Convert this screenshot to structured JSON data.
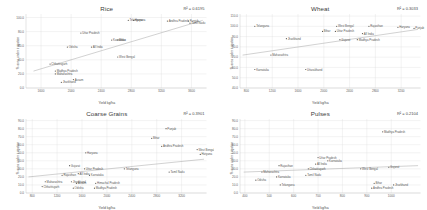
{
  "figure": {
    "layout": "2x2 grid of scatter plots",
    "xlabel": "Yield kg/ha",
    "ylabel": "% area under irrigation"
  },
  "chart_data": [
    {
      "type": "scatter",
      "title": "Rice",
      "annotation": "R² = 0.6195",
      "xlabel": "Yield kg/ha",
      "ylabel": "% area under irrigation",
      "xlim": [
        1400,
        3800
      ],
      "ylim": [
        0,
        105
      ],
      "xticks": [
        1600,
        2000,
        2400,
        2800,
        3200,
        3600
      ],
      "xticklabels": [
        "1600",
        "2000",
        "2400",
        "2800",
        "3200",
        "3600"
      ],
      "yticks": [
        0,
        20,
        40,
        60,
        80,
        100
      ],
      "yticklabels": [
        "0.0",
        "20.0",
        "40.0",
        "60.0",
        "80.0",
        "100.0"
      ],
      "grid": true,
      "trendline": {
        "x": [
          1500,
          3750
        ],
        "y": [
          24,
          96
        ]
      },
      "points": [
        {
          "label": "Telangana",
          "x": 2760,
          "y": 96
        },
        {
          "label": "Haryana",
          "x": 2830,
          "y": 96
        },
        {
          "label": "Andhra Pradesh",
          "x": 3280,
          "y": 95
        },
        {
          "label": "Punjab",
          "x": 3560,
          "y": 95
        },
        {
          "label": "Tamil Nadu",
          "x": 3580,
          "y": 92
        },
        {
          "label": "Uttar Pradesh",
          "x": 2130,
          "y": 78
        },
        {
          "label": "Karnataka",
          "x": 2540,
          "y": 68
        },
        {
          "label": "Bihar",
          "x": 2620,
          "y": 68
        },
        {
          "label": "Odisha",
          "x": 1950,
          "y": 58
        },
        {
          "label": "All India",
          "x": 2270,
          "y": 58
        },
        {
          "label": "West Bengal",
          "x": 2620,
          "y": 44
        },
        {
          "label": "Chhattisgarh",
          "x": 1720,
          "y": 34
        },
        {
          "label": "Madhya Pradesh",
          "x": 1790,
          "y": 24
        },
        {
          "label": "Maharashtra",
          "x": 1790,
          "y": 20
        },
        {
          "label": "Assam",
          "x": 2030,
          "y": 12
        },
        {
          "label": "Jharkhand",
          "x": 1870,
          "y": 8
        }
      ]
    },
    {
      "type": "scatter",
      "title": "Wheat",
      "annotation": "R² = 0.3033",
      "xlabel": "Yield kg/ha",
      "ylabel": "% area under irrigation",
      "xlim": [
        700,
        3500
      ],
      "ylim": [
        40,
        112
      ],
      "xticks": [
        800,
        1200,
        1600,
        2000,
        2400,
        2800,
        3200
      ],
      "xticklabels": [
        "800",
        "1200",
        "1600",
        "2000",
        "2400",
        "2800",
        "3200"
      ],
      "yticks": [
        40,
        50,
        60,
        70,
        80,
        90,
        100,
        110
      ],
      "yticklabels": [
        "40.0",
        "50.0",
        "60.0",
        "70.0",
        "80.0",
        "90.0",
        "100.0",
        "110.0"
      ],
      "grid": true,
      "trendline": {
        "x": [
          740,
          3460
        ],
        "y": [
          72,
          97
        ]
      },
      "points": [
        {
          "label": "Telangana",
          "x": 930,
          "y": 100
        },
        {
          "label": "West Bengal",
          "x": 2200,
          "y": 100
        },
        {
          "label": "Rajasthan",
          "x": 2700,
          "y": 100
        },
        {
          "label": "Haryana",
          "x": 3150,
          "y": 99
        },
        {
          "label": "Punjab",
          "x": 3400,
          "y": 98
        },
        {
          "label": "Bihar",
          "x": 1980,
          "y": 95
        },
        {
          "label": "Uttar Pradesh",
          "x": 2180,
          "y": 95
        },
        {
          "label": "All India",
          "x": 2600,
          "y": 93
        },
        {
          "label": "Jharkhand",
          "x": 1420,
          "y": 88
        },
        {
          "label": "Gujarat",
          "x": 2250,
          "y": 87
        },
        {
          "label": "Madhya Pradesh",
          "x": 2520,
          "y": 87
        },
        {
          "label": "Maharashtra",
          "x": 1180,
          "y": 72
        },
        {
          "label": "Karnataka",
          "x": 930,
          "y": 58
        },
        {
          "label": "Uttarakhand",
          "x": 1720,
          "y": 58
        }
      ]
    },
    {
      "type": "scatter",
      "title": "Coarse Grains",
      "annotation": "R² = 0.3901",
      "xlabel": "Yield kg/ha",
      "ylabel": "% area under irrigation",
      "xlim": [
        700,
        3600
      ],
      "ylim": [
        0,
        92
      ],
      "xticks": [
        800,
        1200,
        1600,
        2000,
        2400,
        2800,
        3200
      ],
      "xticklabels": [
        "800",
        "1200",
        "1600",
        "2000",
        "2400",
        "2800",
        "3200"
      ],
      "yticks": [
        0,
        10,
        20,
        30,
        40,
        50,
        60,
        70,
        80,
        90
      ],
      "yticklabels": [
        "0.0",
        "10.0",
        "20.0",
        "30.0",
        "40.0",
        "50.0",
        "60.0",
        "70.0",
        "80.0",
        "90.0"
      ],
      "grid": true,
      "trendline": {
        "x": [
          740,
          3560
        ],
        "y": [
          20,
          42
        ]
      },
      "points": [
        {
          "label": "Punjab",
          "x": 2950,
          "y": 80
        },
        {
          "label": "Bihar",
          "x": 2720,
          "y": 68
        },
        {
          "label": "Andhra Pradesh",
          "x": 2880,
          "y": 58
        },
        {
          "label": "West Bengal",
          "x": 3450,
          "y": 54
        },
        {
          "label": "Haryana",
          "x": 3500,
          "y": 48
        },
        {
          "label": "Haryana",
          "x": 1660,
          "y": 50
        },
        {
          "label": "Telangana",
          "x": 2280,
          "y": 30
        },
        {
          "label": "Tamil Nadu",
          "x": 3000,
          "y": 26
        },
        {
          "label": "Uttar Pradesh",
          "x": 1640,
          "y": 30
        },
        {
          "label": "Gujarat",
          "x": 1400,
          "y": 34
        },
        {
          "label": "All India",
          "x": 1540,
          "y": 24
        },
        {
          "label": "Rajasthan",
          "x": 1280,
          "y": 22
        },
        {
          "label": "Karnataka",
          "x": 1720,
          "y": 22
        },
        {
          "label": "Maharashtra",
          "x": 1010,
          "y": 14
        },
        {
          "label": "Jharkhand",
          "x": 1430,
          "y": 14
        },
        {
          "label": "Assam",
          "x": 1510,
          "y": 12
        },
        {
          "label": "Himachal Pradesh",
          "x": 1820,
          "y": 12
        },
        {
          "label": "Chhattisgarh",
          "x": 960,
          "y": 8
        },
        {
          "label": "Odisha",
          "x": 1460,
          "y": 6
        },
        {
          "label": "Madhya Pradesh",
          "x": 1800,
          "y": 6
        }
      ]
    },
    {
      "type": "scatter",
      "title": "Pulses",
      "annotation": "R² = 0.2104",
      "xlabel": "Yield kg/ha",
      "ylabel": "% area under irrigation",
      "xlim": [
        380,
        1120
      ],
      "ylim": [
        0,
        92
      ],
      "xticks": [
        400,
        500,
        600,
        700,
        800,
        900,
        1000
      ],
      "xticklabels": [
        "400",
        "500",
        "600",
        "700",
        "800",
        "900",
        "1000"
      ],
      "yticks": [
        0,
        10,
        20,
        30,
        40,
        50,
        60,
        70,
        80,
        90
      ],
      "yticklabels": [
        "0.0",
        "10.0",
        "20.0",
        "30.0",
        "40.0",
        "50.0",
        "60.0",
        "70.0",
        "80.0",
        "90.0"
      ],
      "grid": true,
      "trendline": {
        "x": [
          395,
          1110
        ],
        "y": [
          26,
          34
        ]
      },
      "points": [
        {
          "label": "Madhya Pradesh",
          "x": 965,
          "y": 76
        },
        {
          "label": "Uttar Pradesh",
          "x": 700,
          "y": 44
        },
        {
          "label": "Karnataka",
          "x": 740,
          "y": 40
        },
        {
          "label": "All India",
          "x": 690,
          "y": 36
        },
        {
          "label": "Rajasthan",
          "x": 540,
          "y": 34
        },
        {
          "label": "Chhattisgarh",
          "x": 660,
          "y": 30
        },
        {
          "label": "West Bengal",
          "x": 875,
          "y": 30
        },
        {
          "label": "Gujarat",
          "x": 990,
          "y": 32
        },
        {
          "label": "Maharashtra",
          "x": 470,
          "y": 26
        },
        {
          "label": "Tamil Nadu",
          "x": 650,
          "y": 22
        },
        {
          "label": "Karnataka",
          "x": 530,
          "y": 20
        },
        {
          "label": "Odisha",
          "x": 445,
          "y": 16
        },
        {
          "label": "Telangana",
          "x": 545,
          "y": 10
        },
        {
          "label": "Bihar",
          "x": 930,
          "y": 12
        },
        {
          "label": "Jharkhand",
          "x": 1010,
          "y": 10
        },
        {
          "label": "Andhra Pradesh",
          "x": 920,
          "y": 6
        }
      ]
    }
  ]
}
